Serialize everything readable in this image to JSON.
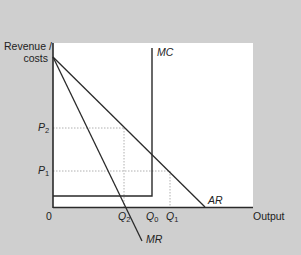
{
  "diagram": {
    "type": "economics-monopoly-revenue-cost",
    "y_axis_label_line1": "Revenue /",
    "y_axis_label_line2": "costs",
    "x_axis_label": "Output",
    "origin_label": "0",
    "price_labels": [
      {
        "letter": "P",
        "sub": "2"
      },
      {
        "letter": "P",
        "sub": "1"
      }
    ],
    "quantity_labels": [
      {
        "letter": "Q",
        "sub": "2"
      },
      {
        "letter": "Q",
        "sub": "0"
      },
      {
        "letter": "Q",
        "sub": "1"
      }
    ],
    "curves": {
      "mc": "MC",
      "ar": "AR",
      "mr": "MR"
    },
    "colors": {
      "background": "#cfcfcf",
      "plot": "#ffffff",
      "line": "#2a2a2a",
      "guide": "#b8b8b8"
    }
  }
}
